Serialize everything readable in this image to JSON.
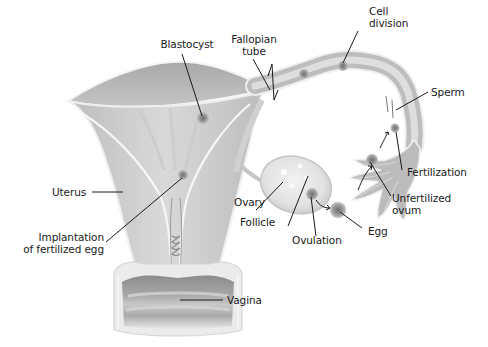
{
  "diagram": {
    "colors": {
      "background": "#ffffff",
      "tissue_light": "#d6d6d6",
      "tissue_mid": "#b4b4b4",
      "tissue_dark": "#8a8a8a",
      "outline": "#f4f4f4",
      "leader_line": "#1a1a1a",
      "text": "#1a1a1a"
    },
    "labels": {
      "blastocyst": "Blastocyst",
      "fallopian_tube_1": "Fallopian",
      "fallopian_tube_2": "tube",
      "cell_division_1": "Cell",
      "cell_division_2": "division",
      "sperm": "Sperm",
      "fertilization": "Fertilization",
      "unfertilized_ovum_1": "Unfertilized",
      "unfertilized_ovum_2": "ovum",
      "egg": "Egg",
      "ovulation": "Ovulation",
      "follicle": "Follicle",
      "ovary": "Ovary",
      "uterus": "Uterus",
      "implantation_1": "Implantation",
      "implantation_2": "of fertilized egg",
      "vagina": "Vagina"
    }
  }
}
